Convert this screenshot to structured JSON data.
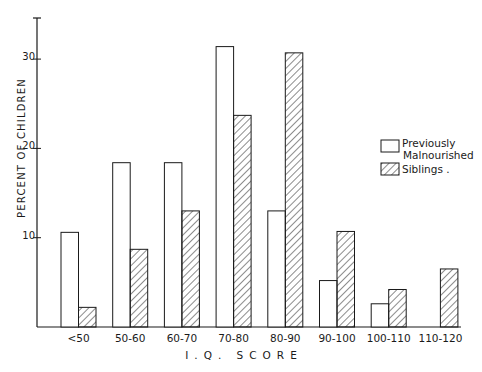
{
  "chart_data": {
    "type": "bar",
    "title": "",
    "xlabel": "I.Q. SCORE",
    "ylabel": "PERCENT OF CHILDREN",
    "ylim": [
      0,
      33
    ],
    "yticks": [
      10,
      20,
      30
    ],
    "grid": false,
    "legend_position": "right",
    "categories": [
      "<50",
      "50-60",
      "60-70",
      "70-80",
      "80-90",
      "90-100",
      "100-110",
      "110-120"
    ],
    "series": [
      {
        "name": "Previously Malnourished",
        "pattern": "open",
        "values": [
          10.6,
          18.4,
          18.4,
          31.4,
          13.0,
          5.2,
          2.6,
          0
        ]
      },
      {
        "name": "Siblings",
        "pattern": "hatched",
        "values": [
          2.2,
          8.7,
          13.0,
          23.7,
          30.7,
          10.7,
          4.2,
          6.5
        ]
      }
    ]
  },
  "legend": {
    "items": [
      {
        "line1": "Previously",
        "line2": "Malnourished"
      },
      {
        "line1": "Siblings ."
      }
    ]
  },
  "colors": {
    "ink": "#1a1a1a",
    "background": "#ffffff"
  }
}
